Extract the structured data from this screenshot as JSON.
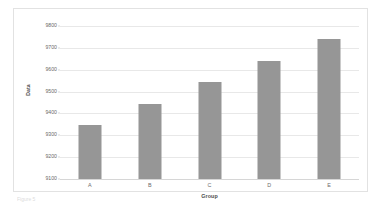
{
  "chart_data": {
    "type": "bar",
    "title": "",
    "categories": [
      "A",
      "B",
      "C",
      "D",
      "E"
    ],
    "values": [
      9345,
      9445,
      9545,
      9640,
      9740
    ],
    "xlabel": "Group",
    "ylabel": "Data",
    "ylim": [
      9100,
      9800
    ],
    "yticks": [
      9800,
      9700,
      9600,
      9500,
      9400,
      9300,
      9200,
      9100
    ],
    "ytick_labels": [
      "9800",
      "9700",
      "9600",
      "9500",
      "9400",
      "9300",
      "9200",
      "9100"
    ],
    "grid": true,
    "legend": false,
    "series": [
      {
        "name": "Data",
        "values": [
          9345,
          9445,
          9545,
          9640,
          9740
        ]
      }
    ],
    "colors": {
      "bar": "#969696",
      "gridline": "#e8e8e8",
      "axis": "#d6d6d6",
      "frame_border": "#e2e2e2",
      "tick_text": "#6b6b6b",
      "axis_title_text": "#4d4d4d",
      "plot_background": "#ffffff"
    }
  },
  "caption": {
    "fragment": "Figure 5"
  }
}
